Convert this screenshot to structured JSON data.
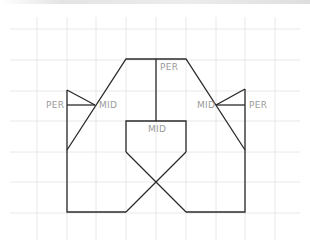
{
  "canvas": {
    "width": 310,
    "height": 243,
    "background": "#ffffff",
    "line_color": "#2a2a2a",
    "grid_color": "#e2e2e2",
    "label_color": "#9a9a9a"
  },
  "grid": {
    "vertical_x": [
      37,
      67,
      96,
      126,
      156,
      186,
      216,
      245,
      275
    ],
    "horizontal_y": [
      29,
      60,
      91,
      121,
      152,
      182,
      213
    ],
    "x_range": [
      10,
      300
    ],
    "y_range": [
      17,
      240
    ]
  },
  "labels": {
    "per_top": "PER",
    "per_left": "PER",
    "per_right": "PER",
    "mid_left": "MID",
    "mid_right": "MID",
    "mid_center": "MID"
  },
  "snap_markers": [
    {
      "type": "PER",
      "x": 158,
      "y": 68,
      "meaning": "perpendicular"
    },
    {
      "type": "PER",
      "x": 46,
      "y": 108,
      "meaning": "perpendicular"
    },
    {
      "type": "PER",
      "x": 249,
      "y": 108,
      "meaning": "perpendicular"
    },
    {
      "type": "MID",
      "x": 99,
      "y": 108,
      "meaning": "midpoint"
    },
    {
      "type": "MID",
      "x": 197,
      "y": 108,
      "meaning": "midpoint"
    },
    {
      "type": "MID",
      "x": 146,
      "y": 133,
      "meaning": "midpoint"
    }
  ]
}
